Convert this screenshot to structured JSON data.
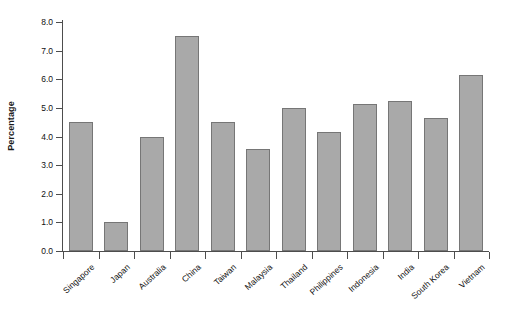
{
  "chart_data": {
    "type": "bar",
    "title": "",
    "subtitle": "",
    "xlabel": "",
    "ylabel": "Percentage",
    "ylim": [
      0.0,
      8.0
    ],
    "ytick_labels": [
      "0.0",
      "1.0",
      "2.0",
      "3.0",
      "4.0",
      "5.0",
      "6.0",
      "7.0",
      "8.0"
    ],
    "ytick_values": [
      0.0,
      1.0,
      2.0,
      3.0,
      4.0,
      5.0,
      6.0,
      7.0,
      8.0
    ],
    "grid": false,
    "legend": null,
    "categories": [
      "Singapore",
      "Japan",
      "Australia",
      "China",
      "Taiwan",
      "Malaysia",
      "Thailand",
      "Philippines",
      "Indonesia",
      "India",
      "South Korea",
      "Vietnam"
    ],
    "values": [
      4.5,
      1.0,
      4.0,
      7.5,
      4.5,
      3.55,
      5.0,
      4.15,
      5.15,
      5.25,
      4.65,
      6.15
    ],
    "bar_fill_color": "#a9a9a9",
    "bar_edge_color": "#767676",
    "axis_color": "#4d4d4d",
    "background_color": "#ffffff"
  }
}
